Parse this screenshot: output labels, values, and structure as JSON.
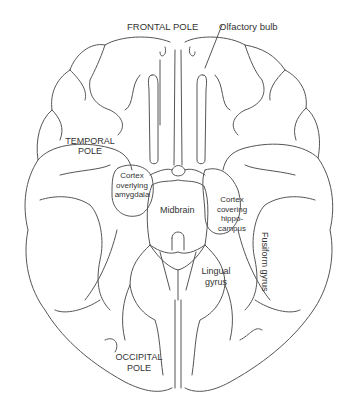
{
  "diagram": {
    "labels": {
      "frontal_pole": "FRONTAL POLE",
      "olfactory_bulb": "Olfactory bulb",
      "temporal_pole_line1": "TEMPORAL",
      "temporal_pole_line2": "POLE",
      "amygdala_line1": "Cortex",
      "amygdala_line2": "overlying",
      "amygdala_line3": "amygdala",
      "midbrain": "Midbrain",
      "hippocampus_line1": "Cortex",
      "hippocampus_line2": "covering",
      "hippocampus_line3": "hippo-",
      "hippocampus_line4": "campus",
      "lingual_line1": "Lingual",
      "lingual_line2": "gyrus",
      "fusiform": "Fusiform gyrus",
      "occipital_pole_line1": "OCCIPITAL",
      "occipital_pole_line2": "POLE"
    },
    "colors": {
      "line": "#555555",
      "text": "#333333",
      "background": "#ffffff"
    }
  }
}
